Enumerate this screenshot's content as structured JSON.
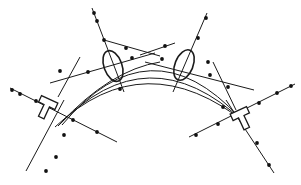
{
  "canvas": {
    "width": 301,
    "height": 185,
    "background": "#ffffff",
    "stroke": "#1a1a1a",
    "dot": "#111111"
  },
  "arcs": [
    {
      "d": "M62 125 Q 150 20 240 118"
    },
    {
      "d": "M58 126 Q 148 32 244 122"
    },
    {
      "d": "M55 127 Q 145 42 247 124"
    },
    {
      "d": "M60 124 Q 110 70 160 62"
    }
  ],
  "lines": [
    {
      "x1": 92,
      "y1": 8,
      "x2": 124,
      "y2": 92
    },
    {
      "x1": 104,
      "y1": 40,
      "x2": 160,
      "y2": 56
    },
    {
      "x1": 50,
      "y1": 83,
      "x2": 155,
      "y2": 53
    },
    {
      "x1": 58,
      "y1": 97,
      "x2": 80,
      "y2": 57
    },
    {
      "x1": 207,
      "y1": 13,
      "x2": 173,
      "y2": 92
    },
    {
      "x1": 140,
      "y1": 55,
      "x2": 175,
      "y2": 43
    },
    {
      "x1": 145,
      "y1": 62,
      "x2": 254,
      "y2": 90
    },
    {
      "x1": 213,
      "y1": 62,
      "x2": 236,
      "y2": 110
    },
    {
      "x1": 10,
      "y1": 88,
      "x2": 117,
      "y2": 142
    },
    {
      "x1": 64,
      "y1": 100,
      "x2": 26,
      "y2": 171
    },
    {
      "x1": 189,
      "y1": 137,
      "x2": 295,
      "y2": 84
    },
    {
      "x1": 226,
      "y1": 100,
      "x2": 274,
      "y2": 173
    }
  ],
  "dots": [
    [
      94,
      13
    ],
    [
      97,
      21
    ],
    [
      104,
      40
    ],
    [
      126,
      48
    ],
    [
      132,
      58
    ],
    [
      120,
      89
    ],
    [
      206,
      18
    ],
    [
      198,
      38
    ],
    [
      165,
      46
    ],
    [
      162,
      59
    ],
    [
      208,
      62
    ],
    [
      210,
      75
    ],
    [
      228,
      87
    ],
    [
      223,
      107
    ],
    [
      12,
      90
    ],
    [
      20,
      94
    ],
    [
      36,
      101
    ],
    [
      73,
      120
    ],
    [
      97,
      132
    ],
    [
      60,
      71
    ],
    [
      88,
      72
    ],
    [
      64,
      135
    ],
    [
      56,
      157
    ],
    [
      46,
      171
    ],
    [
      196,
      135
    ],
    [
      218,
      124
    ],
    [
      259,
      103
    ],
    [
      277,
      93
    ],
    [
      291,
      86
    ],
    [
      257,
      143
    ],
    [
      269,
      165
    ]
  ],
  "clamps": [
    {
      "type": "oval",
      "name": "clamp-oval-left",
      "cx": 113,
      "cy": 66,
      "rx": 9,
      "ry": 16,
      "rotate": -20
    },
    {
      "type": "oval",
      "name": "clamp-oval-right",
      "cx": 184,
      "cy": 65,
      "rx": 9,
      "ry": 16,
      "rotate": 22
    },
    {
      "type": "tee",
      "name": "clamp-tee-left",
      "x": 48,
      "y": 103,
      "rotate": 25
    },
    {
      "type": "tee",
      "name": "clamp-tee-right",
      "x": 240,
      "y": 114,
      "rotate": -25
    }
  ]
}
